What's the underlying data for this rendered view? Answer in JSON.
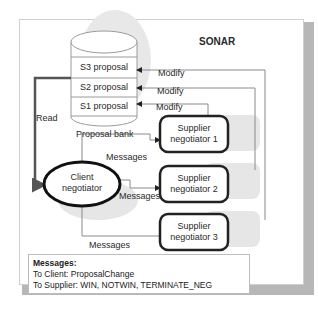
{
  "diagram": {
    "title": "SONAR",
    "proposal_bank": {
      "label": "Proposal bank",
      "slots": [
        "S3 proposal",
        "S2 proposal",
        "S1 proposal"
      ]
    },
    "client": {
      "label_line1": "Client",
      "label_line2": "negotiator"
    },
    "suppliers": [
      {
        "line1": "Supplier",
        "line2": "negotiator 1"
      },
      {
        "line1": "Supplier",
        "line2": "negotiator  2"
      },
      {
        "line1": "Supplier",
        "line2": "negotiator  3"
      }
    ],
    "edges": {
      "read": "Read",
      "modify": [
        "Modify",
        "Modify",
        "Modify"
      ],
      "messages": [
        "Messages",
        "Messages",
        "Messages"
      ]
    },
    "legend": {
      "title": "Messages:",
      "line1": "To Client: ProposalChange",
      "line2": "To Supplier: WIN, NOTWIN, TERMINATE_NEG"
    },
    "colors": {
      "frame_shadow": "#b7b7b7",
      "node_border": "#111111",
      "read_arrow": "#555555",
      "connector": "#8a8a8a"
    }
  }
}
